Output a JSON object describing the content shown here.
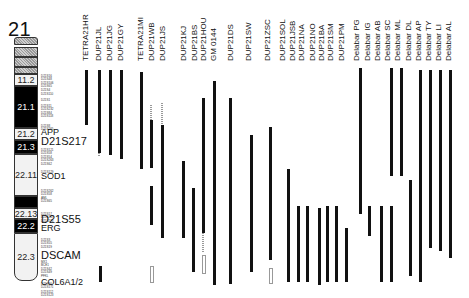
{
  "chromosome": {
    "number": "21",
    "bands": [
      {
        "id": "p-top",
        "label": "",
        "top": 37,
        "height": 8,
        "style": "hatch cap-top"
      },
      {
        "id": "p-mid1",
        "label": "",
        "top": 47,
        "height": 10,
        "style": "hatch"
      },
      {
        "id": "p-mid2",
        "label": "",
        "top": 57,
        "height": 10,
        "style": "hatch"
      },
      {
        "id": "p-mid3",
        "label": "",
        "top": 67,
        "height": 7,
        "style": "hatch"
      },
      {
        "id": "11.2",
        "label": "11.2",
        "top": 74,
        "height": 12,
        "style": "light"
      },
      {
        "id": "21.1",
        "label": "21.1",
        "top": 86,
        "height": 42,
        "style": "dark"
      },
      {
        "id": "21.2",
        "label": "21.2",
        "top": 128,
        "height": 12,
        "style": "light"
      },
      {
        "id": "21.3",
        "label": "21.3",
        "top": 140,
        "height": 14,
        "style": "dark"
      },
      {
        "id": "22.11",
        "label": "22.11",
        "top": 154,
        "height": 42,
        "style": "light"
      },
      {
        "id": "22.12",
        "label": "",
        "top": 196,
        "height": 12,
        "style": "dark"
      },
      {
        "id": "22.13",
        "label": "22.13",
        "top": 208,
        "height": 11,
        "style": "light"
      },
      {
        "id": "22.2",
        "label": "22.2",
        "top": 219,
        "height": 14,
        "style": "dark"
      },
      {
        "id": "22.3",
        "label": "22.3",
        "top": 233,
        "height": 48,
        "style": "light cap-bot"
      }
    ],
    "markers": [
      {
        "top": 75,
        "lines": [
          "D21S16",
          "D21S48",
          "D21S106",
          "D21S65",
          "D21S4"
        ]
      },
      {
        "top": 93,
        "lines": [
          "D21S110"
        ]
      },
      {
        "top": 99,
        "lines": [
          "D21S1"
        ]
      },
      {
        "top": 105,
        "lines": [
          "D21S11",
          "D21S232",
          "D21S84",
          "D21S118"
        ]
      },
      {
        "top": 125,
        "lines": [
          "D21S8",
          "D21S265"
        ]
      },
      {
        "top": 149,
        "lines": [
          "D21S121",
          "D21S58",
          "D21S54",
          "D21S263"
        ]
      },
      {
        "top": 163,
        "lines": [
          "D21S62"
        ]
      },
      {
        "top": 171,
        "lines": [
          "D21S129"
        ]
      },
      {
        "top": 190,
        "lines": [
          "D21S262",
          "D21S58",
          "AML",
          "D21S65"
        ]
      },
      {
        "top": 213,
        "lines": [
          "D21S17",
          "D21S267",
          "D21S270"
        ]
      },
      {
        "top": 239,
        "lines": [
          "D21S3",
          "D21S55",
          "D21S19"
        ]
      },
      {
        "top": 261,
        "lines": [
          "MX1",
          "BCE1",
          "D21S42",
          "D21S49",
          "PFKL"
        ]
      },
      {
        "top": 283,
        "lines": [
          "D21S66",
          "D21S171"
        ]
      },
      {
        "top": 291,
        "lines": [
          "D21S112",
          "D21S123"
        ]
      }
    ],
    "genes": [
      {
        "label": "APP",
        "top": 128,
        "size": "normal"
      },
      {
        "label": "D21S217",
        "top": 137,
        "size": "big"
      },
      {
        "label": "SOD1",
        "top": 172,
        "size": "normal"
      },
      {
        "label": "D21S55",
        "top": 215,
        "size": "big"
      },
      {
        "label": "ERG",
        "top": 224,
        "size": "normal"
      },
      {
        "label": "DSCAM",
        "top": 251,
        "size": "big"
      },
      {
        "label": "COL6A1/2",
        "top": 278,
        "size": "normal"
      }
    ]
  },
  "subjects": [
    {
      "label": "TETRA21HR",
      "x": 85
    },
    {
      "label": "DUP21JL",
      "x": 98
    },
    {
      "label": "DUP21JG",
      "x": 109
    },
    {
      "label": "DUP21GY",
      "x": 120
    },
    {
      "label": "TETRA21MI",
      "x": 140
    },
    {
      "label": "DUP21WB",
      "x": 151
    },
    {
      "label": "DUP21JS",
      "x": 162
    },
    {
      "label": "DUP21KJ",
      "x": 183
    },
    {
      "label": "DUP21BS",
      "x": 194
    },
    {
      "label": "DUP21HOU",
      "x": 203
    },
    {
      "label": "GM 0144",
      "x": 213
    },
    {
      "label": "DUP21DS",
      "x": 230
    },
    {
      "label": "DUP21SW",
      "x": 248
    },
    {
      "label": "DUP21ZSC",
      "x": 267
    },
    {
      "label": "DUP21SOL",
      "x": 282
    },
    {
      "label": "DUP21JSB",
      "x": 292
    },
    {
      "label": "DUP21NA",
      "x": 301
    },
    {
      "label": "DUP21NO",
      "x": 312
    },
    {
      "label": "DUP21BA",
      "x": 321
    },
    {
      "label": "DUP21SM",
      "x": 330
    },
    {
      "label": "DUP21PM",
      "x": 341
    },
    {
      "label": "Delabar PG",
      "x": 356
    },
    {
      "label": "Delabar IG",
      "x": 367
    },
    {
      "label": "Delabar AB",
      "x": 377
    },
    {
      "label": "Delabar SC",
      "x": 387
    },
    {
      "label": "Delabar ML",
      "x": 397
    },
    {
      "label": "Delabar DL",
      "x": 408
    },
    {
      "label": "Delabar AP",
      "x": 418
    },
    {
      "label": "Delabar TY",
      "x": 428
    },
    {
      "label": "Delabar LI",
      "x": 438
    },
    {
      "label": "Delabar AL",
      "x": 448
    }
  ],
  "bars": [
    {
      "x": 85,
      "top": 70,
      "bottom": 125,
      "type": "solid"
    },
    {
      "x": 98,
      "top": 70,
      "bottom": 153,
      "type": "solid"
    },
    {
      "x": 98,
      "top": 153,
      "bottom": 156,
      "type": "dashed"
    },
    {
      "x": 109,
      "top": 70,
      "bottom": 155,
      "type": "solid"
    },
    {
      "x": 120,
      "top": 70,
      "bottom": 159,
      "type": "solid"
    },
    {
      "x": 99,
      "top": 266,
      "bottom": 282,
      "type": "solid"
    },
    {
      "x": 140,
      "top": 72,
      "bottom": 169,
      "type": "solid"
    },
    {
      "x": 150,
      "top": 105,
      "bottom": 120,
      "type": "dashed"
    },
    {
      "x": 150,
      "top": 120,
      "bottom": 168,
      "type": "solid"
    },
    {
      "x": 150,
      "top": 186,
      "bottom": 225,
      "type": "solid"
    },
    {
      "x": 150,
      "top": 266,
      "bottom": 281,
      "type": "hollow"
    },
    {
      "x": 161,
      "top": 103,
      "bottom": 125,
      "type": "dashed"
    },
    {
      "x": 161,
      "top": 125,
      "bottom": 238,
      "type": "solid"
    },
    {
      "x": 182,
      "top": 161,
      "bottom": 238,
      "type": "solid"
    },
    {
      "x": 192,
      "top": 188,
      "bottom": 272,
      "type": "solid"
    },
    {
      "x": 202,
      "top": 98,
      "bottom": 233,
      "type": "solid"
    },
    {
      "x": 202,
      "top": 233,
      "bottom": 252,
      "type": "dashed"
    },
    {
      "x": 202,
      "top": 255,
      "bottom": 272,
      "type": "hollow"
    },
    {
      "x": 213,
      "top": 81,
      "bottom": 285,
      "type": "solid"
    },
    {
      "x": 229,
      "top": 98,
      "bottom": 284,
      "type": "solid"
    },
    {
      "x": 250,
      "top": 135,
      "bottom": 272,
      "type": "solid"
    },
    {
      "x": 269,
      "top": 127,
      "bottom": 260,
      "type": "solid"
    },
    {
      "x": 269,
      "top": 268,
      "bottom": 282,
      "type": "hollow"
    },
    {
      "x": 287,
      "top": 169,
      "bottom": 282,
      "type": "solid"
    },
    {
      "x": 297,
      "top": 206,
      "bottom": 282,
      "type": "solid"
    },
    {
      "x": 306,
      "top": 206,
      "bottom": 282,
      "type": "solid"
    },
    {
      "x": 318,
      "top": 208,
      "bottom": 285,
      "type": "solid"
    },
    {
      "x": 326,
      "top": 206,
      "bottom": 282,
      "type": "solid"
    },
    {
      "x": 335,
      "top": 206,
      "bottom": 282,
      "type": "solid"
    },
    {
      "x": 345,
      "top": 228,
      "bottom": 282,
      "type": "solid"
    },
    {
      "x": 359,
      "top": 68,
      "bottom": 214,
      "type": "solid"
    },
    {
      "x": 368,
      "top": 206,
      "bottom": 236,
      "type": "solid"
    },
    {
      "x": 380,
      "top": 206,
      "bottom": 282,
      "type": "solid"
    },
    {
      "x": 390,
      "top": 68,
      "bottom": 176,
      "type": "solid"
    },
    {
      "x": 390,
      "top": 206,
      "bottom": 282,
      "type": "solid"
    },
    {
      "x": 400,
      "top": 68,
      "bottom": 176,
      "type": "solid"
    },
    {
      "x": 409,
      "top": 180,
      "bottom": 276,
      "type": "solid"
    },
    {
      "x": 419,
      "top": 70,
      "bottom": 282,
      "type": "solid"
    },
    {
      "x": 429,
      "top": 70,
      "bottom": 248,
      "type": "solid"
    },
    {
      "x": 439,
      "top": 70,
      "bottom": 251,
      "type": "solid"
    },
    {
      "x": 449,
      "top": 70,
      "bottom": 258,
      "type": "solid"
    }
  ]
}
